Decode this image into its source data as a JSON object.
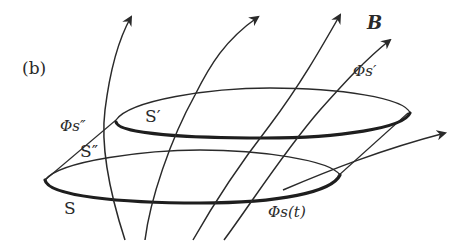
{
  "figure": {
    "panel_label": "(b)",
    "vector_label": "B",
    "surfaces": {
      "upper": "S′",
      "side": "S″",
      "lower": "S"
    },
    "flux_labels": {
      "upper": "Φs′",
      "side": "Φs″",
      "lower": "Φs(t)"
    },
    "colors": {
      "ink": "#2a2a2a",
      "background": "#ffffff"
    },
    "field_line_count": 5
  }
}
